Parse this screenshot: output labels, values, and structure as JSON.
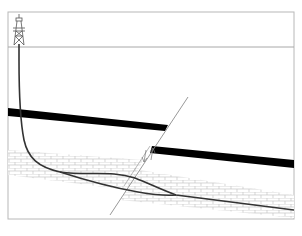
{
  "diagram": {
    "type": "geological-cross-section",
    "colors": {
      "background": "#ffffff",
      "frame": "#b8b8b8",
      "surface_line": "#a0a0a0",
      "seam": "#000000",
      "well": "#333333",
      "fault": "#909090",
      "reservoir_pattern": "#c8c8c8"
    },
    "elements": [
      {
        "id": "derrick",
        "label": "drilling rig"
      },
      {
        "id": "surface",
        "label": "ground surface"
      },
      {
        "id": "seam-left",
        "label": "black seam (upthrown block)"
      },
      {
        "id": "seam-right",
        "label": "black seam (downthrown block)"
      },
      {
        "id": "reservoir-left",
        "label": "reservoir layer (left block)"
      },
      {
        "id": "reservoir-right",
        "label": "reservoir layer (right block)"
      },
      {
        "id": "fault",
        "label": "fault plane"
      },
      {
        "id": "well-upper",
        "label": "well path branch 1"
      },
      {
        "id": "well-lower",
        "label": "well path branch 2"
      }
    ]
  }
}
